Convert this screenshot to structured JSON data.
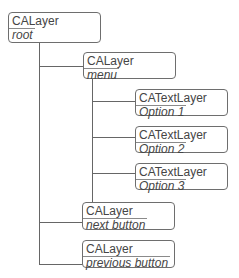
{
  "diagram": {
    "nodes": [
      {
        "id": "root",
        "class": "CALayer",
        "name": "root"
      },
      {
        "id": "menu",
        "class": "CALayer",
        "name": "menu",
        "parent": "root"
      },
      {
        "id": "opt1",
        "class": "CATextLayer",
        "name": "Option 1",
        "parent": "menu"
      },
      {
        "id": "opt2",
        "class": "CATextLayer",
        "name": "Option 2",
        "parent": "menu"
      },
      {
        "id": "opt3",
        "class": "CATextLayer",
        "name": "Option 3",
        "parent": "menu"
      },
      {
        "id": "next",
        "class": "CALayer",
        "name": "next button",
        "parent": "root"
      },
      {
        "id": "prev",
        "class": "CALayer",
        "name": "previous button",
        "parent": "root"
      }
    ],
    "colors": {
      "border": "#6e6e6e",
      "line": "#666666",
      "text": "#454545"
    }
  }
}
